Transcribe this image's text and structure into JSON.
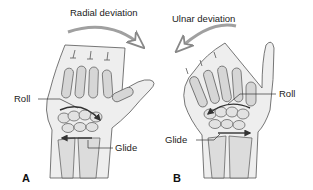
{
  "panels": [
    {
      "id": "A",
      "letter": "A",
      "motion_label": "Radial deviation",
      "arrow_direction": "clockwise-right",
      "callouts": {
        "roll": "Roll",
        "glide": "Glide"
      }
    },
    {
      "id": "B",
      "letter": "B",
      "motion_label": "Ulnar deviation",
      "arrow_direction": "counterclockwise-left",
      "callouts": {
        "roll": "Roll",
        "glide": "Glide"
      }
    }
  ],
  "colors": {
    "outline": "#555555",
    "skin_fill": "#ececec",
    "bone_fill": "#d8d8d8",
    "bone_shade": "#bdbdbd",
    "arrow": "#333333",
    "motion_arrow": "#9a9a9a",
    "background": "#ffffff"
  }
}
